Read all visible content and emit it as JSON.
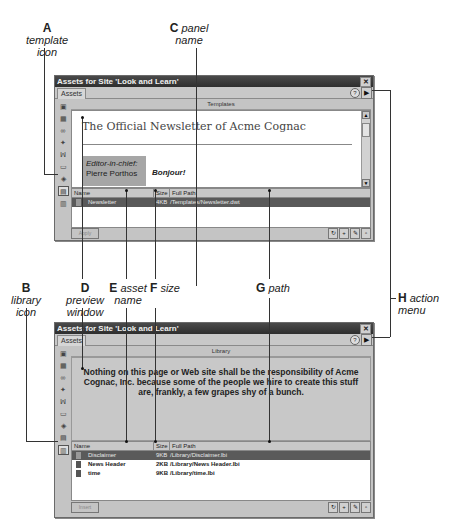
{
  "callouts": {
    "A": {
      "letter": "A",
      "text": "template icon"
    },
    "B": {
      "letter": "B",
      "text": "library icon"
    },
    "C": {
      "letter": "C",
      "text": "panel name"
    },
    "D": {
      "letter": "D",
      "text": "preview window"
    },
    "E": {
      "letter": "E",
      "text": "asset name"
    },
    "F": {
      "letter": "F",
      "text": "size"
    },
    "G": {
      "letter": "G",
      "text": "path"
    },
    "H": {
      "letter": "H",
      "text": "action menu"
    }
  },
  "icons": {
    "close": "✕",
    "help": "?",
    "action_menu": "▶",
    "scroll_up": "▲",
    "scroll_down": "▼",
    "sidebar": [
      "images-icon",
      "colors-icon",
      "urls-icon",
      "flash-icon",
      "shockwave-icon",
      "movies-icon",
      "scripts-icon",
      "templates-icon",
      "library-icon"
    ],
    "footer": [
      "refresh-icon",
      "new-icon",
      "edit-icon",
      "delete-icon"
    ]
  },
  "windows": [
    {
      "title": "Assets for Site 'Look and Learn'",
      "tab": "Assets",
      "panel_name": "Templates",
      "preview": {
        "heading": "The Official Newsletter of Acme Cognac",
        "editor_label": "Editor-in-chief:",
        "editor_name": "Pierre Porthos",
        "greeting": "Bonjour!"
      },
      "columns": {
        "name": "Name",
        "size": "Size",
        "path": "Full Path"
      },
      "rows": [
        {
          "name": "Newsletter",
          "size": "4KB",
          "path": "/Templates/Newsletter.dwt",
          "selected": true
        }
      ],
      "insert_label": "Apply"
    },
    {
      "title": "Assets for Site 'Look and Learn'",
      "tab": "Assets",
      "panel_name": "Library",
      "preview": {
        "text": "Nothing on this page or Web site shall be the responsibility of Acme Cognac, Inc. because some of the people we hire to create this stuff are, frankly, a few grapes shy of a bunch."
      },
      "columns": {
        "name": "Name",
        "size": "Size",
        "path": "Full Path"
      },
      "rows": [
        {
          "name": "Disclaimer",
          "size": "9KB",
          "path": "/Library/Disclaimer.lbi",
          "selected": true
        },
        {
          "name": "News Header",
          "size": "2KB",
          "path": "/Library/News Header.lbi",
          "selected": false
        },
        {
          "name": "time",
          "size": "9KB",
          "path": "/Library/time.lbi",
          "selected": false
        }
      ],
      "insert_label": "Insert"
    }
  ]
}
